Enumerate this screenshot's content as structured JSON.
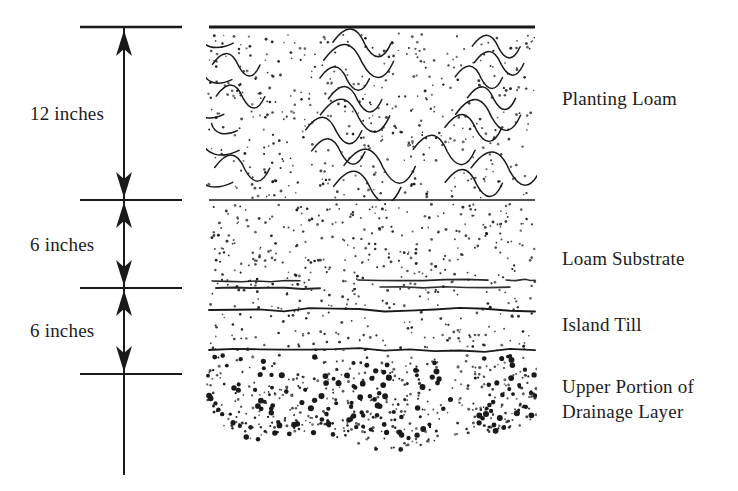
{
  "figure": {
    "kind": "soil-profile-cross-section",
    "title": "",
    "ink_color": "#1a1a1a",
    "background_color": "#ffffff"
  },
  "dimensions": {
    "axis_x": 124,
    "ticks_y": [
      27,
      200,
      288,
      374
    ],
    "items": [
      {
        "label": "12 inches",
        "value": 12,
        "unit": "inches",
        "from_y": 27,
        "to_y": 200,
        "label_x": 30,
        "label_y": 103
      },
      {
        "label": "6 inches",
        "value": 6,
        "unit": "inches",
        "from_y": 200,
        "to_y": 288,
        "label_x": 30,
        "label_y": 234
      },
      {
        "label": "6 inches",
        "value": 6,
        "unit": "inches",
        "from_y": 288,
        "to_y": 374,
        "label_x": 30,
        "label_y": 320
      }
    ]
  },
  "profile": {
    "left_x": 210,
    "right_x": 533,
    "top_y": 27,
    "bottom_y": 470,
    "layers": [
      {
        "name": "Planting Loam",
        "label": "Planting Loam",
        "top_y": 27,
        "bottom_y": 200,
        "texture": "dots-and-squiggles",
        "label_x": 562,
        "label_y": 86
      },
      {
        "name": "Loam Substrate",
        "label": "Loam Substrate",
        "top_y": 200,
        "bottom_y": 288,
        "texture": "fine-dots",
        "label_x": 562,
        "label_y": 246
      },
      {
        "name": "Island Till",
        "label": "Island Till",
        "top_y": 288,
        "bottom_y": 350,
        "texture": "fine-dots-with-stone-lines",
        "label_x": 562,
        "label_y": 312
      },
      {
        "name": "Upper Portion of Drainage Layer",
        "label": "Upper Portion of",
        "label_line2": "Drainage Layer",
        "top_y": 350,
        "bottom_y": 470,
        "texture": "coarse-gravel-dots",
        "label_x": 562,
        "label_y": 374
      }
    ]
  }
}
